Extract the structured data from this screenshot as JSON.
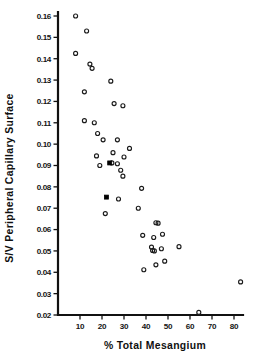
{
  "chart_data": {
    "type": "scatter",
    "title": "",
    "xlabel": "% Total Mesangium",
    "ylabel": "S/V Peripheral Capillary Surface",
    "xlim": [
      0,
      86
    ],
    "ylim": [
      0.02,
      0.163
    ],
    "grid": false,
    "legend": null,
    "xticks": [
      10,
      20,
      30,
      40,
      50,
      60,
      70,
      80
    ],
    "xtick_labels": [
      "10",
      "20",
      "30",
      "40",
      "50",
      "60",
      "70",
      "80"
    ],
    "yticks": [
      0.02,
      0.03,
      0.04,
      0.05,
      0.06,
      0.07,
      0.08,
      0.09,
      0.1,
      0.11,
      0.12,
      0.13,
      0.14,
      0.15,
      0.16
    ],
    "ytick_labels": [
      "0.02",
      "0.03",
      "0.04",
      "0.05",
      "0.06",
      "0.07",
      "0.08",
      "0.09",
      "0.10",
      "0.11",
      "0.12",
      "0.13",
      "0.14",
      "0.15",
      "0.16"
    ],
    "marker_styles": {
      "open": "open-circle",
      "filled": "filled-square"
    },
    "series": [
      {
        "name": "open-circle-points",
        "marker": "open",
        "points": [
          [
            8.0,
            0.16
          ],
          [
            13.0,
            0.153
          ],
          [
            8.0,
            0.1425
          ],
          [
            14.5,
            0.1375
          ],
          [
            15.5,
            0.1355
          ],
          [
            24.0,
            0.1295
          ],
          [
            12.0,
            0.1245
          ],
          [
            25.5,
            0.119
          ],
          [
            29.5,
            0.118
          ],
          [
            12.0,
            0.111
          ],
          [
            16.5,
            0.11
          ],
          [
            18.0,
            0.105
          ],
          [
            20.5,
            0.102
          ],
          [
            27.0,
            0.102
          ],
          [
            32.5,
            0.098
          ],
          [
            25.0,
            0.096
          ],
          [
            17.5,
            0.0945
          ],
          [
            30.0,
            0.094
          ],
          [
            24.5,
            0.0912
          ],
          [
            27.0,
            0.0908
          ],
          [
            19.0,
            0.09
          ],
          [
            28.5,
            0.0878
          ],
          [
            29.5,
            0.085
          ],
          [
            38.0,
            0.0793
          ],
          [
            27.5,
            0.0743
          ],
          [
            36.5,
            0.07
          ],
          [
            21.5,
            0.0675
          ],
          [
            44.5,
            0.0632
          ],
          [
            45.5,
            0.063
          ],
          [
            47.5,
            0.0578
          ],
          [
            38.5,
            0.0573
          ],
          [
            43.5,
            0.0563
          ],
          [
            55.0,
            0.052
          ],
          [
            42.5,
            0.0518
          ],
          [
            47.0,
            0.051
          ],
          [
            43.0,
            0.0502
          ],
          [
            43.8,
            0.05
          ],
          [
            48.5,
            0.0452
          ],
          [
            44.5,
            0.0435
          ],
          [
            39.0,
            0.0412
          ],
          [
            83.0,
            0.0355
          ],
          [
            64.0,
            0.0212
          ]
        ]
      },
      {
        "name": "filled-square-points",
        "marker": "filled",
        "points": [
          [
            23.5,
            0.0912
          ],
          [
            22.0,
            0.0752
          ]
        ]
      }
    ]
  },
  "figure": {
    "axis_color": "#111111",
    "marker_color": "#1a1a1a",
    "background": "#ffffff"
  }
}
